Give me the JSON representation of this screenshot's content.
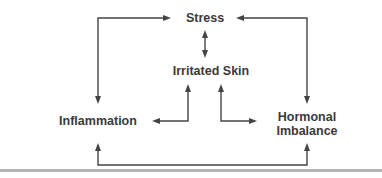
{
  "diagram": {
    "type": "cycle-relationship",
    "nodes": [
      {
        "id": "stress",
        "lines": [
          "Stress"
        ]
      },
      {
        "id": "irritated_skin",
        "lines": [
          "Irritated Skin"
        ]
      },
      {
        "id": "inflammation",
        "lines": [
          "Inflammation"
        ]
      },
      {
        "id": "hormonal_imbalance",
        "lines": [
          "Hormonal",
          "Imbalance"
        ]
      }
    ],
    "edges": [
      {
        "from": "stress",
        "to": "irritated_skin",
        "bidirectional": true
      },
      {
        "from": "stress",
        "to": "inflammation",
        "bidirectional": true
      },
      {
        "from": "stress",
        "to": "hormonal_imbalance",
        "bidirectional": true
      },
      {
        "from": "irritated_skin",
        "to": "inflammation",
        "bidirectional": true
      },
      {
        "from": "irritated_skin",
        "to": "hormonal_imbalance",
        "bidirectional": true
      },
      {
        "from": "inflammation",
        "to": "hormonal_imbalance",
        "bidirectional": true
      }
    ],
    "colors": {
      "text": "#3a3a3a",
      "line": "#444444",
      "separator": "#b4b4b4"
    }
  }
}
